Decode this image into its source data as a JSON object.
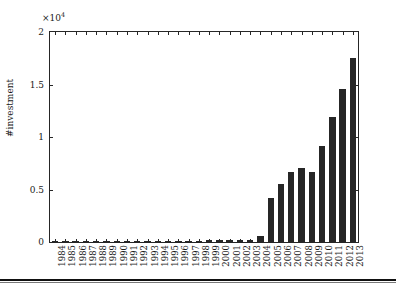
{
  "chart_data": {
    "type": "bar",
    "title": "",
    "xlabel": "",
    "ylabel": "#investment",
    "y_exponent_label": "×10",
    "y_exponent_power": "4",
    "y_exponent_multiplier": 10000,
    "ylim": [
      0,
      2
    ],
    "y_ticks": [
      "0",
      "0.5",
      "1",
      "1.5",
      "2"
    ],
    "y_tick_values": [
      0,
      0.5,
      1,
      1.5,
      2
    ],
    "grid": false,
    "legend": null,
    "bar_color": "#262626",
    "axis_color": "#262626",
    "categories": [
      "1984",
      "1985",
      "1986",
      "1987",
      "1988",
      "1989",
      "1990",
      "1991",
      "1992",
      "1993",
      "1994",
      "1995",
      "1996",
      "1997",
      "1998",
      "1999",
      "2000",
      "2001",
      "2002",
      "2003",
      "2004",
      "2005",
      "2006",
      "2007",
      "2008",
      "2009",
      "2010",
      "2011",
      "2012",
      "2013"
    ],
    "values": [
      20,
      20,
      20,
      20,
      20,
      20,
      30,
      30,
      30,
      30,
      30,
      30,
      40,
      50,
      60,
      160,
      230,
      170,
      180,
      190,
      600,
      4200,
      5550,
      6650,
      7050,
      6700,
      9100,
      11950,
      14550,
      17550
    ],
    "units": "count"
  }
}
